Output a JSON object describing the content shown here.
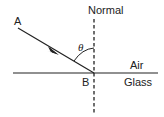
{
  "diagram": {
    "labels": {
      "normal": "Normal",
      "point_a": "A",
      "point_b": "B",
      "angle": "θ",
      "medium_top": "Air",
      "medium_bottom": "Glass"
    },
    "colors": {
      "line": "#222222",
      "background": "#ffffff"
    }
  }
}
